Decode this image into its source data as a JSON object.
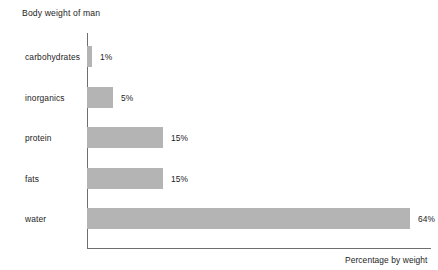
{
  "chart_data": {
    "type": "bar",
    "orientation": "horizontal",
    "title": "Body weight of man",
    "xlabel": "Percentage by weight",
    "ylabel": "",
    "categories": [
      "carbohydrates",
      "inorganics",
      "protein",
      "fats",
      "water"
    ],
    "values": [
      1,
      5,
      15,
      15,
      64
    ],
    "value_labels": [
      "1%",
      "5%",
      "15%",
      "15%",
      "64%"
    ],
    "xlim": [
      0,
      68
    ],
    "grid": false,
    "legend": null,
    "bar_color": "#b4b4b4",
    "axis_color": "#6e6e6e",
    "text_color": "#1c1c1c",
    "background": "#ffffff"
  },
  "bars": [
    {
      "category": "carbohydrates",
      "value": 1,
      "value_label": "1%",
      "bar_px": 5,
      "top_px": 46,
      "label_center_px": 57
    },
    {
      "category": "inorganics",
      "value": 5,
      "value_label": "5%",
      "bar_px": 26,
      "top_px": 87,
      "label_center_px": 98
    },
    {
      "category": "protein",
      "value": 15,
      "value_label": "15%",
      "bar_px": 76,
      "top_px": 127,
      "label_center_px": 138
    },
    {
      "category": "fats",
      "value": 15,
      "value_label": "15%",
      "bar_px": 76,
      "top_px": 168,
      "label_center_px": 179
    },
    {
      "category": "water",
      "value": 64,
      "value_label": "64%",
      "bar_px": 323,
      "top_px": 208,
      "label_center_px": 219
    }
  ]
}
